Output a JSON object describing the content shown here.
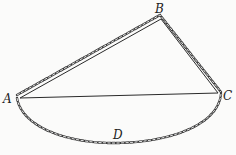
{
  "diagram": {
    "type": "geometry",
    "colors": {
      "line": "#2a2a2a",
      "chain": "#3a3a3a",
      "background": "#fbfbfa"
    },
    "points": {
      "A": {
        "label": "A",
        "x": 20,
        "y": 98
      },
      "B": {
        "label": "B",
        "x": 161,
        "y": 19
      },
      "C": {
        "label": "C",
        "x": 218,
        "y": 93
      },
      "D": {
        "label": "D",
        "x": 119,
        "y": 137
      }
    },
    "segments": [
      {
        "from": "A",
        "to": "B",
        "style": "solid+chain"
      },
      {
        "from": "B",
        "to": "C",
        "style": "solid+chain"
      },
      {
        "from": "A",
        "to": "C",
        "style": "solid"
      }
    ],
    "arcs": [
      {
        "from": "A",
        "via": "D",
        "to": "C",
        "style": "chain"
      }
    ]
  }
}
